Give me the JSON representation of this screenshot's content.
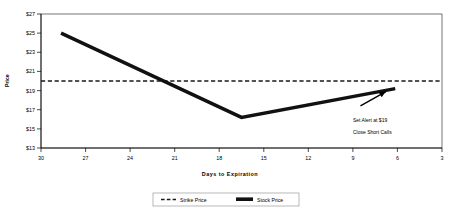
{
  "chart_data": {
    "type": "line",
    "title": "",
    "xlabel": "Days to Expiration",
    "ylabel": "Price",
    "xlim": [
      31.5,
      1.5
    ],
    "ylim": [
      13,
      27
    ],
    "x_ticks": [
      30,
      27,
      24,
      21,
      18,
      15,
      12,
      9,
      6,
      3
    ],
    "y_ticks": [
      "$13",
      "$15",
      "$17",
      "$19",
      "$21",
      "$23",
      "$25",
      "$27"
    ],
    "y_tick_values": [
      13,
      15,
      17,
      19,
      21,
      23,
      25,
      27
    ],
    "grid": false,
    "legend_position": "bottom",
    "series": [
      {
        "name": "Strike Price",
        "style": "dashed",
        "color": "#1a1a1a",
        "x": [
          31.5,
          1.5
        ],
        "values": [
          20,
          20
        ]
      },
      {
        "name": "Stock Price",
        "style": "solid-thick",
        "color": "#111111",
        "x": [
          30,
          16.5,
          5
        ],
        "values": [
          25,
          16.2,
          19.2
        ]
      }
    ],
    "annotations": [
      {
        "name": "set-alert-annotation",
        "line1": "Set Alert at $19",
        "line2": "Close Short Calls",
        "arrow_from_x": 7.6,
        "arrow_from_y": 17.4,
        "arrow_to_x": 5.7,
        "arrow_to_y": 18.9
      }
    ]
  },
  "legend": {
    "items": [
      {
        "label": "Strike Price",
        "swatch": "dashed-line-swatch"
      },
      {
        "label": "Stock Price",
        "swatch": "solid-line-swatch"
      }
    ]
  },
  "axes": {
    "y_title": "Price",
    "x_title": "Days to Expiration"
  },
  "colors": {
    "series_stock": "#111111",
    "series_strike": "#1a1a1a",
    "frame": "#3a3a3a",
    "background": "#ffffff"
  }
}
